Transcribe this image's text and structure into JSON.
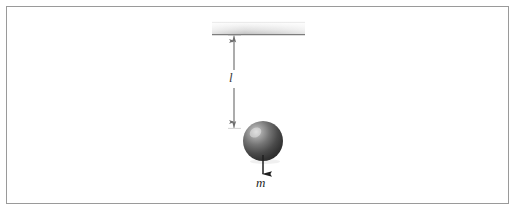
{
  "figure": {
    "background_color": "#ffffff",
    "border_color": "#9a9a9a"
  },
  "labels": {
    "length": "l",
    "mass": "m"
  },
  "elements": {
    "ceiling": {
      "name": "ceiling-support-bar",
      "x": 212,
      "y": 22,
      "width": 93,
      "height": 13,
      "fill_top": "#fcfcfc",
      "fill_bottom": "#c9c9c9",
      "edge_color": "#8a8a8a"
    },
    "string": {
      "name": "pendulum-string",
      "x": 263,
      "y_top": 35,
      "y_bottom": 124,
      "color": "#9b9b9b",
      "width": 1.4
    },
    "bob": {
      "name": "pendulum-bob",
      "cx": 263,
      "cy": 141,
      "r": 20,
      "fill_light": "#b5b5b5",
      "fill_dark": "#2e2e2e",
      "highlight": "#d8d8d8"
    },
    "dimension_line": {
      "name": "length-dimension-line",
      "x": 234,
      "y_top": 35,
      "y_bottom": 128,
      "color": "#6e6e6e"
    },
    "weight_arrow": {
      "name": "weight-force-arrow",
      "x": 263,
      "y_top": 155,
      "y_bottom": 174,
      "color": "#1f1f1f"
    }
  }
}
